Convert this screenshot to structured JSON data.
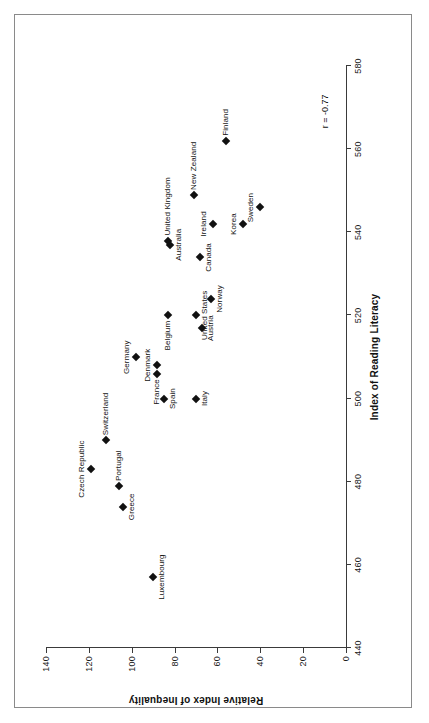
{
  "figure": {
    "corr_annotation": "r = -0.77"
  },
  "chart_data": {
    "type": "scatter",
    "title": "",
    "xlabel": "Index of Reading Literacy",
    "ylabel": "Relative Index of Inequality",
    "xlim": [
      440,
      580
    ],
    "ylim": [
      0,
      140
    ],
    "xticks": [
      440,
      460,
      480,
      500,
      520,
      540,
      560,
      580
    ],
    "yticks": [
      0,
      20,
      40,
      60,
      80,
      100,
      120,
      140
    ],
    "grid": false,
    "legend": null,
    "annotations": [
      "r = -0.77"
    ],
    "points": [
      {
        "label": "Luxembourg",
        "x": 457,
        "y": 90,
        "label_pos": "below"
      },
      {
        "label": "Greece",
        "x": 474,
        "y": 104,
        "label_pos": "below"
      },
      {
        "label": "Portugal",
        "x": 479,
        "y": 106,
        "label_pos": "right"
      },
      {
        "label": "Czech Republic",
        "x": 483,
        "y": 119,
        "label_pos": "above"
      },
      {
        "label": "Switzerland",
        "x": 490,
        "y": 112,
        "label_pos": "right"
      },
      {
        "label": "Spain",
        "x": 500,
        "y": 85,
        "label_pos": "below"
      },
      {
        "label": "Italy",
        "x": 500,
        "y": 70,
        "label_pos": "below"
      },
      {
        "label": "France",
        "x": 506,
        "y": 88,
        "label_pos": "left"
      },
      {
        "label": "Denmark",
        "x": 508,
        "y": 88,
        "label_pos": "above"
      },
      {
        "label": "Germany",
        "x": 510,
        "y": 98,
        "label_pos": "above"
      },
      {
        "label": "Austria",
        "x": 517,
        "y": 67,
        "label_pos": "below"
      },
      {
        "label": "United States",
        "x": 520,
        "y": 70,
        "label_pos": "below"
      },
      {
        "label": "Belgium",
        "x": 520,
        "y": 83,
        "label_pos": "left"
      },
      {
        "label": "Norway",
        "x": 524,
        "y": 63,
        "label_pos": "below"
      },
      {
        "label": "Canada",
        "x": 534,
        "y": 68,
        "label_pos": "below"
      },
      {
        "label": "Australia",
        "x": 537,
        "y": 82,
        "label_pos": "below"
      },
      {
        "label": "United Kingdom",
        "x": 538,
        "y": 83,
        "label_pos": "right"
      },
      {
        "label": "Ireland",
        "x": 542,
        "y": 62,
        "label_pos": "above"
      },
      {
        "label": "Korea",
        "x": 542,
        "y": 48,
        "label_pos": "above"
      },
      {
        "label": "New Zealand",
        "x": 549,
        "y": 71,
        "label_pos": "right"
      },
      {
        "label": "Sweden",
        "x": 546,
        "y": 40,
        "label_pos": "above"
      },
      {
        "label": "Finland",
        "x": 562,
        "y": 56,
        "label_pos": "right"
      }
    ]
  }
}
